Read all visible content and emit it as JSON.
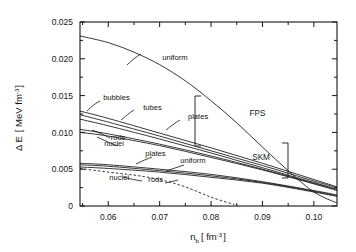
{
  "chart_data": {
    "type": "line",
    "title": "",
    "xlabel": "n_b [ fm^-3 ]",
    "ylabel": "Δ E [ MeV fm^-3 ]",
    "xlim": [
      0.0545,
      0.1045
    ],
    "ylim": [
      0,
      0.025
    ],
    "xticks": [
      0.06,
      0.07,
      0.08,
      0.09,
      0.1
    ],
    "xtick_labels": [
      "0.06",
      "0.07",
      "0.08",
      "0.09",
      "0.10"
    ],
    "yticks": [
      0,
      0.005,
      0.01,
      0.015,
      0.02,
      0.025
    ],
    "ytick_labels": [
      "0",
      "0.005",
      "0.010",
      "0.015",
      "0.020",
      "0.025"
    ],
    "grid": false,
    "legend_position": "inline-annotations",
    "groups": [
      {
        "name": "FPS",
        "bracket": true
      },
      {
        "name": "SKM",
        "bracket": true
      }
    ],
    "series": [
      {
        "name": "uniform-fps-top",
        "label": "uniform",
        "group": "FPS",
        "style": "solid",
        "x": [
          0.0545,
          0.06,
          0.065,
          0.07,
          0.075,
          0.08,
          0.085,
          0.09,
          0.095,
          0.1,
          0.1045
        ],
        "y": [
          0.0231,
          0.0222,
          0.0209,
          0.0192,
          0.017,
          0.0143,
          0.0113,
          0.008,
          0.0048,
          0.0019,
          0.0004
        ]
      },
      {
        "name": "bubbles-fps",
        "label": "bubbles",
        "group": "FPS",
        "style": "solid",
        "x": [
          0.0545,
          0.06,
          0.07,
          0.08,
          0.09,
          0.1,
          0.1045
        ],
        "y": [
          0.0129,
          0.0119,
          0.0099,
          0.0079,
          0.0058,
          0.0036,
          0.0026
        ]
      },
      {
        "name": "tubes-fps",
        "label": "tubes",
        "group": "FPS",
        "style": "solid",
        "x": [
          0.0545,
          0.06,
          0.07,
          0.08,
          0.09,
          0.1,
          0.1045
        ],
        "y": [
          0.0124,
          0.0114,
          0.0095,
          0.0075,
          0.0055,
          0.0034,
          0.0025
        ]
      },
      {
        "name": "plates-fps",
        "label": "plates",
        "group": "FPS",
        "style": "solid",
        "x": [
          0.0545,
          0.06,
          0.07,
          0.08,
          0.09,
          0.1,
          0.1045
        ],
        "y": [
          0.0118,
          0.0109,
          0.0091,
          0.0072,
          0.0052,
          0.0032,
          0.0023
        ]
      },
      {
        "name": "rods-fps",
        "label": "rods",
        "group": "FPS",
        "style": "solid",
        "x": [
          0.0545,
          0.06,
          0.07,
          0.08,
          0.09,
          0.1,
          0.1045
        ],
        "y": [
          0.0104,
          0.0098,
          0.0084,
          0.0068,
          0.005,
          0.0031,
          0.0022
        ]
      },
      {
        "name": "nuclei-fps",
        "label": "nuclei",
        "group": "FPS",
        "style": "solid",
        "x": [
          0.0545,
          0.06,
          0.07,
          0.08,
          0.09,
          0.1,
          0.1045
        ],
        "y": [
          0.01,
          0.0095,
          0.0082,
          0.0066,
          0.0049,
          0.003,
          0.0021
        ]
      },
      {
        "name": "plates-skm",
        "label": "plates",
        "group": "SKM",
        "style": "solid",
        "x": [
          0.0545,
          0.06,
          0.07,
          0.08,
          0.09,
          0.1,
          0.1045
        ],
        "y": [
          0.0058,
          0.0056,
          0.005,
          0.0043,
          0.0033,
          0.0021,
          0.0015
        ]
      },
      {
        "name": "uniform-skm",
        "label": "uniform",
        "group": "SKM",
        "style": "solid",
        "x": [
          0.0545,
          0.06,
          0.07,
          0.08,
          0.09,
          0.1,
          0.1045
        ],
        "y": [
          0.0056,
          0.0054,
          0.0048,
          0.0041,
          0.0032,
          0.002,
          0.0014
        ]
      },
      {
        "name": "rods-skm",
        "label": "rods",
        "group": "SKM",
        "style": "solid",
        "x": [
          0.0545,
          0.06,
          0.07,
          0.08,
          0.09,
          0.1,
          0.1045
        ],
        "y": [
          0.0053,
          0.0051,
          0.0046,
          0.0039,
          0.0031,
          0.0019,
          0.0013
        ]
      },
      {
        "name": "nuclei-skm",
        "label": "nuclei",
        "group": "SKM",
        "style": "dashed",
        "x": [
          0.0545,
          0.06,
          0.065,
          0.07,
          0.075,
          0.08,
          0.0845
        ],
        "y": [
          0.0051,
          0.0046,
          0.0042,
          0.0036,
          0.0026,
          0.0012,
          0.0002
        ]
      }
    ],
    "annotations": [
      {
        "text": "uniform",
        "x": 0.0705,
        "y": 0.0198,
        "name": "label-uniform-top"
      },
      {
        "text": "bubbles",
        "x": 0.059,
        "y": 0.0144,
        "name": "label-bubbles"
      },
      {
        "text": "tubes",
        "x": 0.0668,
        "y": 0.0131,
        "name": "label-tubes"
      },
      {
        "text": "plates",
        "x": 0.0755,
        "y": 0.0118,
        "name": "label-plates-fps"
      },
      {
        "text": "rods",
        "x": 0.0605,
        "y": 0.009,
        "name": "label-rods-fps"
      },
      {
        "text": "nuclei",
        "x": 0.0592,
        "y": 0.0081,
        "name": "label-nuclei-fps"
      },
      {
        "text": "plates",
        "x": 0.0672,
        "y": 0.0068,
        "name": "label-plates-skm"
      },
      {
        "text": "uniform",
        "x": 0.074,
        "y": 0.0058,
        "name": "label-uniform-skm"
      },
      {
        "text": "nuclei",
        "x": 0.0602,
        "y": 0.0035,
        "name": "label-nuclei-skm"
      },
      {
        "text": "rods",
        "x": 0.0678,
        "y": 0.0032,
        "name": "label-rods-skm"
      },
      {
        "text": "FPS",
        "x": 0.0875,
        "y": 0.0122,
        "name": "label-fps-group"
      },
      {
        "text": "SKM",
        "x": 0.088,
        "y": 0.0062,
        "name": "label-skm-group"
      }
    ]
  },
  "axis": {
    "ylabel_delta": "Δ E",
    "ylabel_open": "[ MeV fm",
    "ylabel_exp": "-3",
    "ylabel_close": "]",
    "xlabel_n": "n",
    "xlabel_b": "b",
    "xlabel_open": "[ fm",
    "xlabel_exp": "-3",
    "xlabel_close": "]"
  }
}
